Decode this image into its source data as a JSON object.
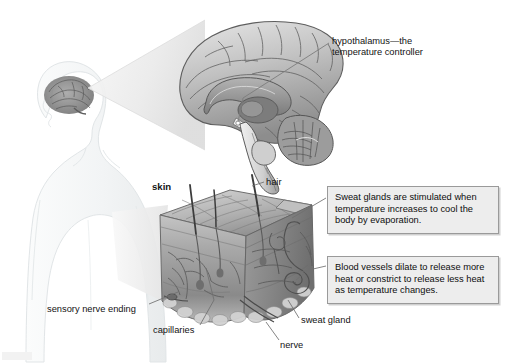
{
  "figure": {
    "background": "#ffffff"
  },
  "labels": {
    "hypothalamus": "hypothalamus—the\ntemperature controller",
    "hypothalamus_line1": "hypothalamus—the",
    "hypothalamus_line2": "temperature controller",
    "skin": "skin",
    "hair": "hair",
    "sensory_nerve_ending": "sensory nerve ending",
    "capillaries": "capillaries",
    "sweat_gland": "sweat gland",
    "nerve": "nerve"
  },
  "callouts": [
    {
      "id": "sweat-glands",
      "text": "Sweat glands are stimulated when temperature increases to cool the body by evaporation.",
      "border_color": "#9a9a9a",
      "fill_color": "#ededed"
    },
    {
      "id": "blood-vessels",
      "text": "Blood vessels dilate to release more heat or constrict to release less heat as temperature changes.",
      "border_color": "#9a9a9a",
      "fill_color": "#ededed"
    }
  ],
  "illustrations": {
    "body_silhouette": "human-head-and-torso-outline-facing-left",
    "small_brain": "brain-inside-head",
    "magnifier_cone_brain": "cone-from-head-to-large-brain",
    "large_brain": "mid-sagittal-brain-section-grayscale",
    "magnifier_cone_skin": "cone-from-body-to-skin-block",
    "skin_block": "three-dimensional-skin-cross-section-block"
  },
  "colors": {
    "label_text": "#131313",
    "leader_line": "#7d7d7d",
    "callout_fill": "#ededed",
    "callout_border": "#9a9a9a",
    "brain_light": "#d9d9d9",
    "brain_mid": "#a8a8a8",
    "brain_dark": "#6e6e6e",
    "skin_light": "#c9c9c9",
    "skin_mid": "#9e9e9e",
    "skin_dark": "#6b6b6b",
    "silhouette": "#f1f3f4"
  }
}
